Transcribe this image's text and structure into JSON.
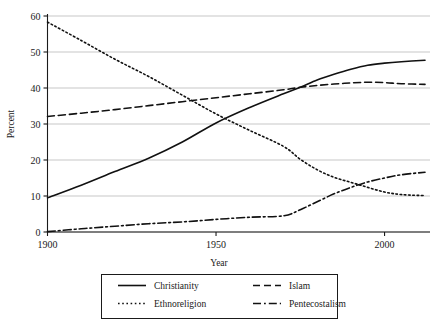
{
  "chart_data": {
    "type": "line",
    "title": "",
    "xlabel": "Year",
    "ylabel": "Percent",
    "xlim": [
      1900,
      2012
    ],
    "ylim": [
      0,
      60
    ],
    "xticks": [
      1900,
      1950,
      2000
    ],
    "xtick_labels": [
      "1900",
      "1950",
      "2000"
    ],
    "yticks": [
      0,
      10,
      20,
      30,
      40,
      50,
      60
    ],
    "ytick_labels": [
      "0",
      "10",
      "20",
      "30",
      "40",
      "50",
      "60"
    ],
    "grid": "horizontal",
    "legend_position": "below-center",
    "x": [
      1900,
      1910,
      1920,
      1930,
      1940,
      1950,
      1960,
      1970,
      1975,
      1980,
      1985,
      1990,
      1995,
      2000,
      2005,
      2012
    ],
    "series": [
      {
        "name": "Christianity",
        "dash": "solid",
        "values": [
          9.5,
          13.0,
          16.8,
          20.5,
          25.0,
          30.3,
          34.6,
          38.4,
          40.2,
          42.2,
          43.8,
          45.2,
          46.3,
          46.9,
          47.3,
          47.7
        ]
      },
      {
        "name": "Islam",
        "dash": "dashed",
        "values": [
          32.1,
          33.0,
          34.0,
          35.1,
          36.2,
          37.3,
          38.4,
          39.5,
          40.2,
          40.7,
          41.1,
          41.4,
          41.6,
          41.5,
          41.2,
          41.0
        ]
      },
      {
        "name": "Ethnoreligion",
        "dash": "dotted",
        "values": [
          58.3,
          53.2,
          48.0,
          43.2,
          38.0,
          32.8,
          28.2,
          23.8,
          20.2,
          17.3,
          15.2,
          13.8,
          12.4,
          11.1,
          10.4,
          10.1
        ]
      },
      {
        "name": "Pentecostalism",
        "dash": "dashdot",
        "values": [
          0.1,
          0.9,
          1.6,
          2.3,
          2.8,
          3.5,
          4.1,
          4.5,
          6.2,
          8.4,
          10.6,
          12.4,
          13.9,
          15.0,
          15.9,
          16.6
        ]
      }
    ]
  },
  "axes": {
    "xlabel": "Year",
    "ylabel": "Percent"
  },
  "legend": {
    "entries": [
      {
        "label": "Christianity",
        "dash": "solid"
      },
      {
        "label": "Islam",
        "dash": "dashed"
      },
      {
        "label": "Ethnoreligion",
        "dash": "dotted"
      },
      {
        "label": "Pentecostalism",
        "dash": "dashdot"
      }
    ]
  },
  "colors": {
    "line": "#111111",
    "grid": "#b9b9b9",
    "axis": "#1a1a1a",
    "background": "#ffffff"
  }
}
